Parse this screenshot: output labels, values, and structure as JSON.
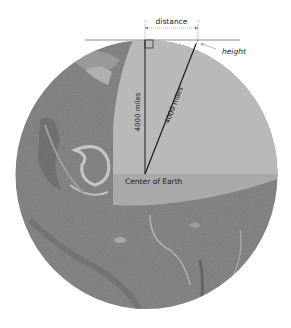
{
  "diagram": {
    "labels": {
      "distance": "distance",
      "height": "height",
      "radius_vertical": "4000 miles",
      "radius_slanted": "4000 miles",
      "center": "Center of Earth"
    },
    "colors": {
      "earth_surface": "#7c7c7c",
      "cut_upper": "#b9b9b9",
      "cut_lower": "#a9a9a9",
      "line": "#1a1a1a",
      "tangent": "#8a8a8a",
      "annotation": "#999999"
    }
  }
}
